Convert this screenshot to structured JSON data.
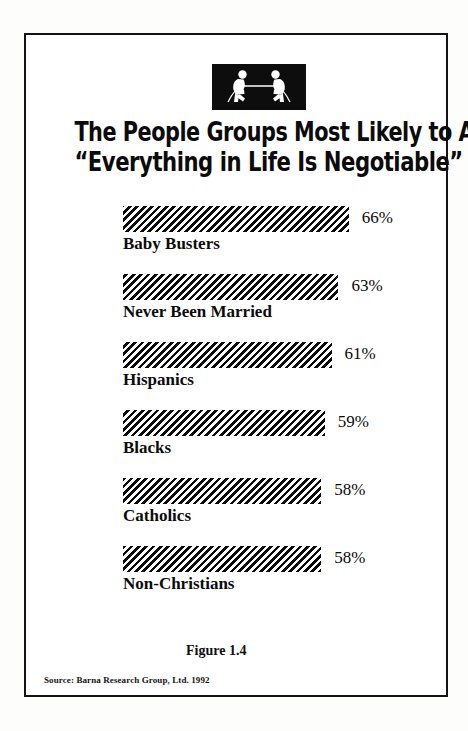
{
  "page": {
    "background_color": "#fdfdfb",
    "frame_color": "#141414"
  },
  "logo": {
    "name": "tug-of-war-icon",
    "description": "two figures pulling a rope",
    "background_color": "#0d0d0d",
    "figure_color": "#ffffff"
  },
  "title": {
    "line1": "The People Groups Most Likely to Agree that",
    "line2": "“Everything in Life Is Negotiable”"
  },
  "figure_caption": "Figure 1.4",
  "source_note": "Source: Barna Research Group, Ltd. 1992",
  "chart_data": {
    "type": "bar",
    "orientation": "horizontal",
    "title": "The People Groups Most Likely to Agree that “Everything in Life Is Negotiable”",
    "xlabel": "",
    "ylabel": "",
    "xlim": [
      0,
      70
    ],
    "grid": false,
    "legend": "none",
    "value_suffix": "%",
    "bar_fill": "diagonal-hatch",
    "bar_color": "#0a0a0a",
    "categories": [
      "Baby Busters",
      "Never Been Married",
      "Hispanics",
      "Blacks",
      "Catholics",
      "Non-Christians"
    ],
    "values": [
      66,
      63,
      61,
      59,
      58,
      58
    ],
    "value_labels": [
      "66%",
      "63%",
      "61%",
      "59%",
      "58%",
      "58%"
    ]
  }
}
